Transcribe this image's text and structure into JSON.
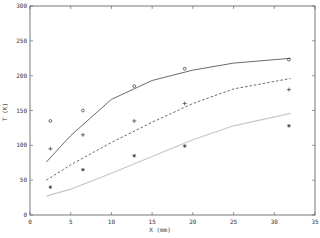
{
  "chart_data": {
    "type": "line",
    "title": "",
    "xlabel": "X  (mm)",
    "ylabel": "T  (K)",
    "xlim": [
      0,
      35
    ],
    "ylim": [
      0,
      300
    ],
    "x_ticks": [
      0,
      5,
      10,
      15,
      20,
      25,
      30,
      35
    ],
    "y_ticks": [
      0,
      50,
      100,
      150,
      200,
      250,
      300
    ],
    "grid": false,
    "legend": null,
    "lines": [
      {
        "name": "solid model",
        "style": "solid",
        "color": "#444444",
        "x": [
          2,
          5,
          10,
          15,
          20,
          25,
          32
        ],
        "y": [
          76,
          114,
          166,
          193,
          208,
          218,
          225
        ]
      },
      {
        "name": "dashed model",
        "style": "dashed",
        "color": "#444444",
        "x": [
          2,
          5,
          10,
          15,
          20,
          25,
          32
        ],
        "y": [
          50,
          72,
          104,
          133,
          160,
          181,
          196
        ]
      },
      {
        "name": "light model",
        "style": "solid-light",
        "color": "#c8c8c8",
        "x": [
          2,
          5,
          10,
          15,
          20,
          25,
          32
        ],
        "y": [
          27,
          37,
          60,
          84,
          108,
          128,
          146
        ]
      }
    ],
    "markers": [
      {
        "name": "circle points",
        "symbol": "o",
        "x": [
          2.5,
          6.5,
          12.8,
          19,
          31.8
        ],
        "y": [
          135,
          150,
          185,
          210,
          223
        ]
      },
      {
        "name": "plus points",
        "symbol": "+",
        "x": [
          2.5,
          6.5,
          12.8,
          19,
          31.8
        ],
        "y": [
          95,
          115,
          135,
          160,
          180
        ]
      },
      {
        "name": "asterisk points",
        "symbol": "*",
        "x": [
          2.5,
          6.5,
          12.8,
          19,
          31.8
        ],
        "y": [
          40,
          65,
          85,
          99,
          128
        ]
      }
    ]
  }
}
